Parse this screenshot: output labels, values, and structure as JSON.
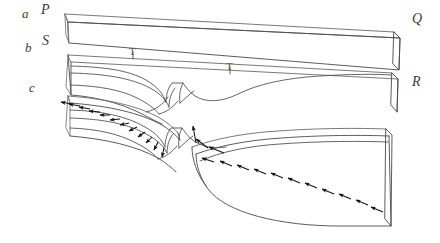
{
  "figure": {
    "kind": "geological-block-diagram",
    "background_color": "#ffffff",
    "line_color": "#4a4a4a",
    "arrow_color": "#141414",
    "row_labels": [
      {
        "name": "row-label-a",
        "text": "a",
        "x": 22,
        "y": 7
      },
      {
        "name": "row-label-b",
        "text": "b",
        "x": 25,
        "y": 41
      },
      {
        "name": "row-label-c",
        "text": "c",
        "x": 29,
        "y": 81
      }
    ],
    "corner_labels": [
      {
        "name": "corner-label-p",
        "text": "P",
        "x": 41,
        "y": 3
      },
      {
        "name": "corner-label-s",
        "text": "S",
        "x": 42,
        "y": 34
      },
      {
        "name": "corner-label-q",
        "text": "Q",
        "x": 412,
        "y": 12
      },
      {
        "name": "corner-label-r",
        "text": "R",
        "x": 412,
        "y": 75
      }
    ],
    "tick_labels": [
      {
        "name": "tick-label-t",
        "text": "T",
        "x": 129,
        "y": 46
      },
      {
        "name": "tick-label-t-prime",
        "text": "T",
        "x": 226,
        "y": 61
      }
    ],
    "slabs": [
      {
        "name": "slab-top-a",
        "label": "a",
        "description": "undeformed top layer, left corner P, right corner Q"
      },
      {
        "name": "slab-middle-b",
        "label": "b",
        "description": "layer with incipient shear zone, left corner S, right corner R"
      },
      {
        "name": "slab-bottom-c",
        "label": "c",
        "description": "layer with fully developed offset and displacement arrows"
      }
    ],
    "arrow_groups": [
      {
        "name": "arrow-group-left-c",
        "count": 12,
        "direction": "down-left",
        "description": "divergent slip arrows along left half of layer c"
      },
      {
        "name": "arrow-group-right-c",
        "count": 11,
        "direction": "up-left",
        "description": "convergent slip arrows along right half of layer c"
      },
      {
        "name": "arrow-group-neck-c",
        "count": 3,
        "direction": "toward-neck",
        "description": "arrows converging on the narrow neck of layer c"
      }
    ]
  }
}
